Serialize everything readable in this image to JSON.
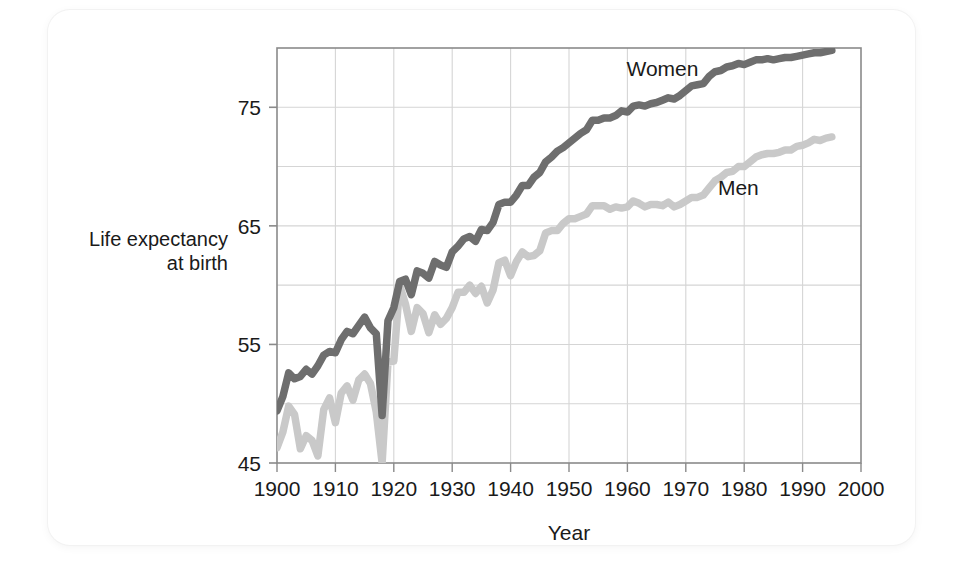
{
  "chart_data": {
    "type": "line",
    "title": "",
    "xlabel": "Year",
    "ylabel": "Life expectancy at birth",
    "ylabel_line1": "Life expectancy",
    "ylabel_line2": "at birth",
    "xlim": [
      1900,
      2000
    ],
    "ylim": [
      45,
      80
    ],
    "xticks": [
      1900,
      1910,
      1920,
      1930,
      1940,
      1950,
      1960,
      1970,
      1980,
      1990,
      2000
    ],
    "xticklabels": [
      "1900",
      "1910",
      "1920",
      "1930",
      "1940",
      "1950",
      "1960",
      "1970",
      "1980",
      "1990",
      "2000"
    ],
    "yticks": [
      45,
      55,
      65,
      75
    ],
    "yticklabels": [
      "45",
      "55",
      "65",
      "75"
    ],
    "ygridlines": [
      45,
      50,
      55,
      60,
      65,
      70,
      75,
      80
    ],
    "grid": true,
    "legend_position": "inline-annotation",
    "annotations": [
      {
        "text": "Women",
        "x": 1966,
        "y": 77.6
      },
      {
        "text": "Men",
        "x": 1979,
        "y": 67.6
      }
    ],
    "colors": {
      "women": "#6e6e6e",
      "men": "#c9c9c9",
      "grid": "#d5d5d5",
      "axis": "#8a8a8a",
      "text": "#1a1a1a",
      "card": "#ffffff",
      "background": "#ffffff"
    },
    "series": [
      {
        "name": "Women",
        "color": "#6e6e6e",
        "x": [
          1900,
          1901,
          1902,
          1903,
          1904,
          1905,
          1906,
          1907,
          1908,
          1909,
          1910,
          1911,
          1912,
          1913,
          1914,
          1915,
          1916,
          1917,
          1918,
          1919,
          1920,
          1921,
          1922,
          1923,
          1924,
          1925,
          1926,
          1927,
          1928,
          1929,
          1930,
          1931,
          1932,
          1933,
          1934,
          1935,
          1936,
          1937,
          1938,
          1939,
          1940,
          1941,
          1942,
          1943,
          1944,
          1945,
          1946,
          1947,
          1948,
          1949,
          1950,
          1951,
          1952,
          1953,
          1954,
          1955,
          1956,
          1957,
          1958,
          1959,
          1960,
          1961,
          1962,
          1963,
          1964,
          1965,
          1966,
          1967,
          1968,
          1969,
          1970,
          1971,
          1972,
          1973,
          1974,
          1975,
          1976,
          1977,
          1978,
          1979,
          1980,
          1981,
          1982,
          1983,
          1984,
          1985,
          1986,
          1987,
          1988,
          1989,
          1990,
          1991,
          1992,
          1993,
          1994,
          1995
        ],
        "y": [
          49.4,
          50.6,
          52.6,
          52.1,
          52.3,
          52.9,
          52.5,
          53.2,
          54.1,
          54.4,
          54.3,
          55.4,
          56.1,
          55.9,
          56.6,
          57.3,
          56.4,
          55.9,
          49.0,
          57.0,
          58.1,
          60.3,
          60.5,
          59.2,
          61.2,
          61.0,
          60.6,
          62.0,
          61.7,
          61.5,
          62.8,
          63.3,
          63.9,
          64.1,
          63.7,
          64.7,
          64.6,
          65.3,
          66.8,
          67.0,
          67.0,
          67.6,
          68.4,
          68.4,
          69.1,
          69.5,
          70.4,
          70.8,
          71.3,
          71.6,
          72.0,
          72.4,
          72.8,
          73.1,
          73.9,
          73.9,
          74.1,
          74.1,
          74.3,
          74.7,
          74.6,
          75.1,
          75.2,
          75.1,
          75.3,
          75.4,
          75.6,
          75.8,
          75.7,
          76.0,
          76.4,
          76.8,
          76.9,
          77.0,
          77.6,
          78.0,
          78.1,
          78.4,
          78.5,
          78.7,
          78.6,
          78.8,
          79.0,
          79.0,
          79.1,
          79.0,
          79.1,
          79.2,
          79.2,
          79.3,
          79.4,
          79.5,
          79.6,
          79.6,
          79.7,
          79.8
        ]
      },
      {
        "name": "Men",
        "color": "#c9c9c9",
        "x": [
          1900,
          1901,
          1902,
          1903,
          1904,
          1905,
          1906,
          1907,
          1908,
          1909,
          1910,
          1911,
          1912,
          1913,
          1914,
          1915,
          1916,
          1917,
          1918,
          1919,
          1920,
          1921,
          1922,
          1923,
          1924,
          1925,
          1926,
          1927,
          1928,
          1929,
          1930,
          1931,
          1932,
          1933,
          1934,
          1935,
          1936,
          1937,
          1938,
          1939,
          1940,
          1941,
          1942,
          1943,
          1944,
          1945,
          1946,
          1947,
          1948,
          1949,
          1950,
          1951,
          1952,
          1953,
          1954,
          1955,
          1956,
          1957,
          1958,
          1959,
          1960,
          1961,
          1962,
          1963,
          1964,
          1965,
          1966,
          1967,
          1968,
          1969,
          1970,
          1971,
          1972,
          1973,
          1974,
          1975,
          1976,
          1977,
          1978,
          1979,
          1980,
          1981,
          1982,
          1983,
          1984,
          1985,
          1986,
          1987,
          1988,
          1989,
          1990,
          1991,
          1992,
          1993,
          1994,
          1995
        ],
        "y": [
          46.3,
          47.6,
          49.8,
          49.1,
          46.2,
          47.3,
          46.9,
          45.6,
          49.5,
          50.5,
          48.4,
          50.9,
          51.5,
          50.3,
          52.0,
          52.5,
          51.7,
          49.3,
          45.0,
          53.5,
          53.6,
          60.0,
          58.4,
          56.1,
          58.1,
          57.6,
          56.0,
          57.5,
          56.7,
          57.2,
          58.1,
          59.4,
          59.4,
          60.0,
          59.3,
          59.9,
          58.5,
          59.6,
          61.9,
          62.1,
          60.8,
          62.0,
          62.8,
          62.4,
          62.5,
          62.9,
          64.4,
          64.6,
          64.6,
          65.2,
          65.6,
          65.6,
          65.8,
          66.0,
          66.7,
          66.7,
          66.7,
          66.4,
          66.6,
          66.5,
          66.6,
          67.1,
          66.9,
          66.6,
          66.8,
          66.8,
          66.7,
          67.0,
          66.6,
          66.8,
          67.1,
          67.4,
          67.4,
          67.6,
          68.2,
          68.8,
          69.1,
          69.5,
          69.6,
          70.0,
          70.0,
          70.4,
          70.8,
          71.0,
          71.1,
          71.1,
          71.2,
          71.4,
          71.4,
          71.7,
          71.8,
          72.0,
          72.3,
          72.2,
          72.4,
          72.5
        ]
      }
    ]
  },
  "figure": {
    "x_axis_title": "Year",
    "y_axis_title_line1": "Life expectancy",
    "y_axis_title_line2": "at birth",
    "series_label_women": "Women",
    "series_label_men": "Men"
  }
}
